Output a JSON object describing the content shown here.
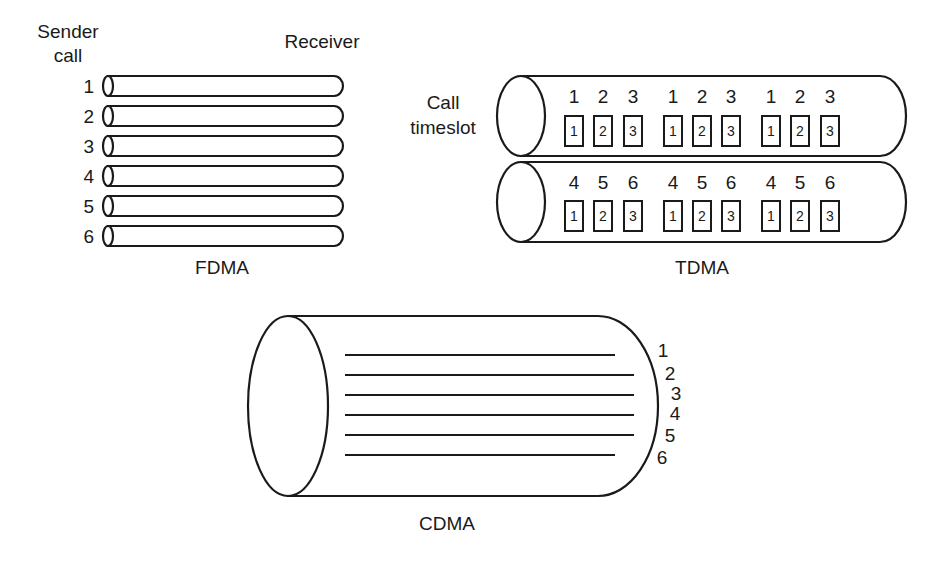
{
  "fdma": {
    "sender_label_line1": "Sender",
    "sender_label_line2": "call",
    "receiver_label": "Receiver",
    "caption": "FDMA",
    "channels": [
      "1",
      "2",
      "3",
      "4",
      "5",
      "6"
    ]
  },
  "tdma": {
    "call_label": "Call",
    "timeslot_label": "timeslot",
    "caption": "TDMA",
    "pipes": [
      {
        "calls": [
          "1",
          "2",
          "3",
          "1",
          "2",
          "3",
          "1",
          "2",
          "3"
        ],
        "slots": [
          "1",
          "2",
          "3",
          "1",
          "2",
          "3",
          "1",
          "2",
          "3"
        ]
      },
      {
        "calls": [
          "4",
          "5",
          "6",
          "4",
          "5",
          "6",
          "4",
          "5",
          "6"
        ],
        "slots": [
          "1",
          "2",
          "3",
          "1",
          "2",
          "3",
          "1",
          "2",
          "3"
        ]
      }
    ]
  },
  "cdma": {
    "caption": "CDMA",
    "channels": [
      "1",
      "2",
      "3",
      "4",
      "5",
      "6"
    ]
  },
  "colors": {
    "ink": "#1a1a1a",
    "background": "#ffffff"
  }
}
